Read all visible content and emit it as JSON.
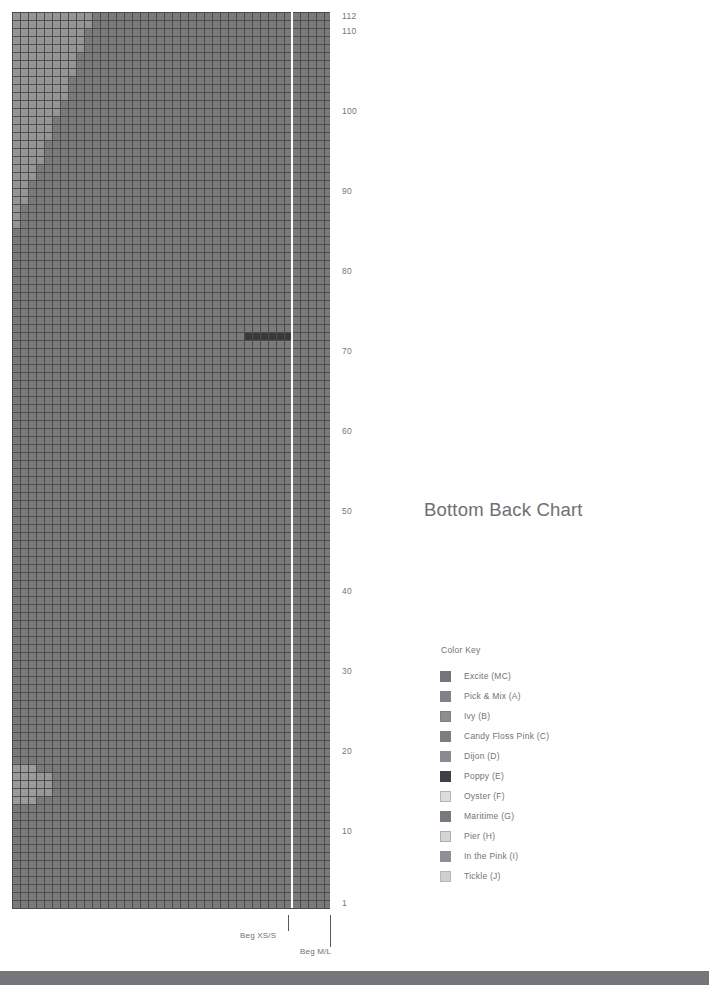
{
  "page": {
    "title": "Bottom Back Chart",
    "background": "#ffffff",
    "footer_bar_color": "#75757a"
  },
  "chart_data": {
    "type": "heatmap",
    "title": "Bottom Back Chart",
    "subtitle": "",
    "xlabel": "",
    "ylabel": "Row",
    "columns": 40,
    "rows": 112,
    "cell_px": 8,
    "grid": true,
    "grid_color": "#4a4a4a",
    "row_tick_labels": [
      112,
      110,
      100,
      90,
      80,
      70,
      60,
      50,
      40,
      30,
      20,
      10,
      1
    ],
    "ylim": [
      1,
      112
    ],
    "base_color": "#7d7d7d",
    "shaping_color": "#999999",
    "accent_dark_color": "#3c3c3c",
    "size_divider_x_column": 35,
    "size_divider_color": "#ffffff",
    "regions": [
      {
        "name": "main-body",
        "color": "#7d7d7d",
        "note": "Excite (MC) field covering full chart"
      },
      {
        "name": "upper-left-shaping",
        "color": "#999999",
        "note": "stepped diagonal decrease, rows 88-112, columns 1-10"
      },
      {
        "name": "lower-left-patch",
        "color": "#a0a0a0",
        "note": "small light block rows 14-18, columns 1-4"
      },
      {
        "name": "dark-row-marker",
        "color": "#3c3c3c",
        "note": "short dark run near row 72, columns 29-34"
      }
    ]
  },
  "size_markers": [
    {
      "id": "beg-xs-s",
      "label": "Beg XS/S",
      "x": 288,
      "label_x": 240,
      "label_y": 931,
      "tick_top": 915,
      "tick_height": 16
    },
    {
      "id": "beg-m-l",
      "label": "Beg M/L",
      "x": 330,
      "label_x": 300,
      "label_y": 947,
      "tick_top": 915,
      "tick_height": 32
    }
  ],
  "color_key": {
    "heading": "Color Key",
    "entries": [
      {
        "label": "Excite (MC)",
        "color": "#74747a",
        "border": "#74747a"
      },
      {
        "label": "Pick & Mix (A)",
        "color": "#818187",
        "border": "#818187"
      },
      {
        "label": "Ivy (B)",
        "color": "#8d8d92",
        "border": "#7e7e84"
      },
      {
        "label": "Candy Floss Pink (C)",
        "color": "#7d7d83",
        "border": "#7d7d83"
      },
      {
        "label": "Dijon (D)",
        "color": "#8a8a90",
        "border": "#8a8a90"
      },
      {
        "label": "Poppy (E)",
        "color": "#3f3f45",
        "border": "#3f3f45"
      },
      {
        "label": "Oyster (F)",
        "color": "#dcdcdc",
        "border": "#b4b4b8"
      },
      {
        "label": "Maritime (G)",
        "color": "#787880",
        "border": "#787880"
      },
      {
        "label": "Pier  (H)",
        "color": "#d5d5d8",
        "border": "#aeaeb2"
      },
      {
        "label": "In the Pink (I)",
        "color": "#8f8f95",
        "border": "#8f8f95"
      },
      {
        "label": "Tickle (J)",
        "color": "#cfcfd3",
        "border": "#b6b6ba"
      }
    ]
  }
}
